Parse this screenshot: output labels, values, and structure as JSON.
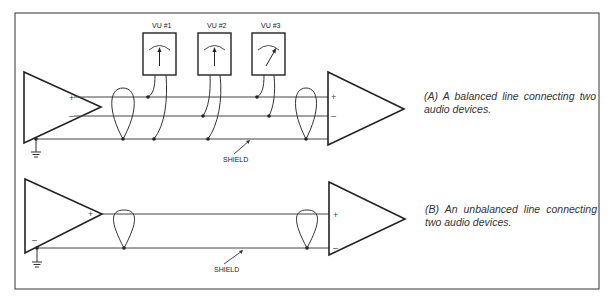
{
  "figure": {
    "panel_a": {
      "caption": "(A)  A balanced line connecting two audio devices.",
      "meters": [
        {
          "label": "VU #1",
          "needle": "center"
        },
        {
          "label": "VU #2",
          "needle": "center"
        },
        {
          "label": "VU #3",
          "needle": "right"
        }
      ],
      "source_pins": {
        "plus": "+",
        "minus": "–"
      },
      "dest_pins": {
        "plus": "+",
        "minus": "–"
      },
      "shield_label": "SHIELD"
    },
    "panel_b": {
      "caption": "(B)  An unbalanced line connecting two audio devices.",
      "source_pins": {
        "plus": "+",
        "minus": "–"
      },
      "dest_pins": {
        "plus": "+",
        "minus": "–"
      },
      "shield_label": "SHIELD"
    },
    "colors": {
      "line": "#2a2a2a",
      "border": "#555555",
      "background": "#ffffff"
    }
  }
}
